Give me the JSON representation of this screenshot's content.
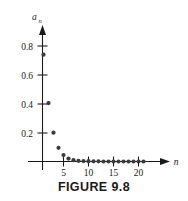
{
  "figure": {
    "caption": "FIGURE 9.8"
  },
  "chart_data": {
    "type": "scatter",
    "title": "",
    "xlabel": "n",
    "ylabel": "a_n",
    "ylabel_base": "a",
    "ylabel_sub": "n",
    "xlim": [
      0,
      23
    ],
    "ylim": [
      0,
      0.92
    ],
    "grid": false,
    "legend": "none",
    "x_ticks": [
      5,
      10,
      15,
      20
    ],
    "x_tick_labels": [
      "5",
      "10",
      "15",
      "20"
    ],
    "y_ticks": [
      0.2,
      0.4,
      0.6,
      0.8
    ],
    "y_tick_labels": [
      "0.2",
      "0.4",
      "0.6",
      "0.8"
    ],
    "marker": "filled-circle",
    "marker_color": "#3b3b3b",
    "axis_color": "#1a1a1a",
    "x": [
      1,
      2,
      3,
      4,
      5,
      6,
      7,
      8,
      9,
      10,
      11,
      12,
      13,
      14,
      15,
      16,
      17,
      18,
      19,
      20,
      21
    ],
    "y": [
      0.74,
      0.405,
      0.2,
      0.095,
      0.045,
      0.02,
      0.009,
      0.005,
      0.003,
      0.002,
      0.001,
      0.001,
      0.0,
      0.0,
      0.0,
      0.0,
      0.0,
      0.0,
      0.0,
      0.0,
      0.0
    ]
  }
}
